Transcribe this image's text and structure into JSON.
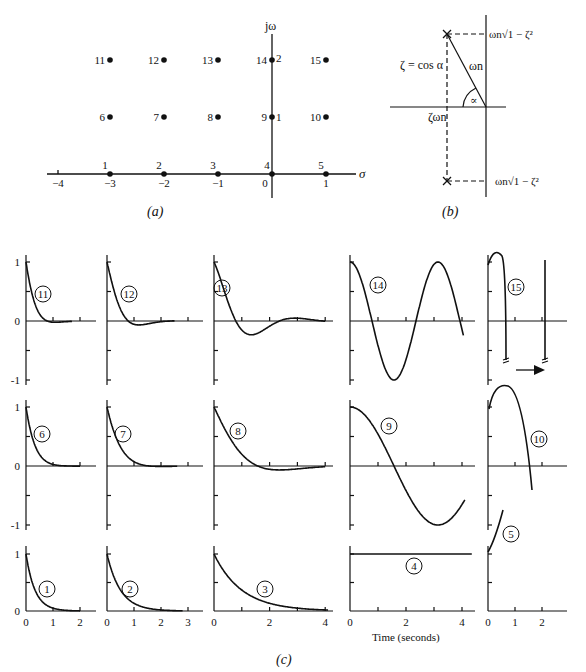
{
  "figure": {
    "panel_a": {
      "caption": "(a)",
      "axis_x_label": "σ",
      "axis_y_label": "jω",
      "x_ticks": [
        "-4",
        "-3",
        "-2",
        "-1",
        "0",
        "1"
      ],
      "points": [
        {
          "id": "1",
          "sigma": -3,
          "omega": 0
        },
        {
          "id": "2",
          "sigma": -2,
          "omega": 0
        },
        {
          "id": "3",
          "sigma": -1,
          "omega": 0
        },
        {
          "id": "4",
          "sigma": 0,
          "omega": 0
        },
        {
          "id": "5",
          "sigma": 1,
          "omega": 0
        },
        {
          "id": "6",
          "sigma": -3,
          "omega": 1
        },
        {
          "id": "7",
          "sigma": -2,
          "omega": 1
        },
        {
          "id": "8",
          "sigma": -1,
          "omega": 1
        },
        {
          "id": "9",
          "sigma": 0,
          "omega": 1
        },
        {
          "id": "10",
          "sigma": 1,
          "omega": 1
        },
        {
          "id": "11",
          "sigma": -3,
          "omega": 2
        },
        {
          "id": "12",
          "sigma": -2,
          "omega": 2
        },
        {
          "id": "13",
          "sigma": -1,
          "omega": 2
        },
        {
          "id": "14",
          "sigma": 0,
          "omega": 2
        },
        {
          "id": "15",
          "sigma": 1,
          "omega": 2
        }
      ],
      "y_marks": [
        "1",
        "2"
      ]
    },
    "panel_b": {
      "caption": "(b)",
      "zeta_label": "ζ = cos α",
      "omega_n_label": "ωn",
      "alpha_label": "∝",
      "zeta_omega_label": "ζωn",
      "upper_label": "ωn√1 − ζ²",
      "lower_label": "ωn√1 − ζ²"
    },
    "panel_c": {
      "caption": "(c)",
      "time_label": "Time (seconds)",
      "y_ticks": [
        "1",
        "0",
        "-1"
      ],
      "col1_ticks": [
        "0",
        "1",
        "2"
      ],
      "col2_ticks": [
        "0",
        "1",
        "2",
        "3"
      ],
      "col3_ticks": [
        "0",
        "2",
        "4"
      ],
      "col4_ticks": [
        "0",
        "2",
        "4"
      ],
      "col5_ticks": [
        "0",
        "1",
        "2"
      ],
      "labels": [
        "1",
        "2",
        "3",
        "4",
        "5",
        "6",
        "7",
        "8",
        "9",
        "10",
        "11",
        "12",
        "13",
        "14",
        "15"
      ]
    }
  },
  "chart_data": {
    "type": "line",
    "xlabel": "Time (seconds)",
    "ylabel": "",
    "pole_positions": [
      {
        "id": 1,
        "sigma": -3,
        "omega": 0
      },
      {
        "id": 2,
        "sigma": -2,
        "omega": 0
      },
      {
        "id": 3,
        "sigma": -1,
        "omega": 0
      },
      {
        "id": 4,
        "sigma": 0,
        "omega": 0
      },
      {
        "id": 5,
        "sigma": 1,
        "omega": 0
      },
      {
        "id": 6,
        "sigma": -3,
        "omega": 1
      },
      {
        "id": 7,
        "sigma": -2,
        "omega": 1
      },
      {
        "id": 8,
        "sigma": -1,
        "omega": 1
      },
      {
        "id": 9,
        "sigma": 0,
        "omega": 1
      },
      {
        "id": 10,
        "sigma": 1,
        "omega": 1
      },
      {
        "id": 11,
        "sigma": -3,
        "omega": 2
      },
      {
        "id": 12,
        "sigma": -2,
        "omega": 2
      },
      {
        "id": 13,
        "sigma": -1,
        "omega": 2
      },
      {
        "id": 14,
        "sigma": 0,
        "omega": 2
      },
      {
        "id": 15,
        "sigma": 1,
        "omega": 2
      }
    ],
    "series": [
      {
        "name": "1",
        "formula": "exp(-3t)",
        "x_range": [
          0,
          2
        ]
      },
      {
        "name": "2",
        "formula": "exp(-2t)",
        "x_range": [
          0,
          3
        ]
      },
      {
        "name": "3",
        "formula": "exp(-t)",
        "x_range": [
          0,
          4
        ]
      },
      {
        "name": "4",
        "formula": "1",
        "x_range": [
          0,
          4.3
        ]
      },
      {
        "name": "5",
        "formula": "exp(t)",
        "x_range": [
          0,
          0.7
        ]
      },
      {
        "name": "6",
        "formula": "exp(-3t)cos(t)",
        "x_range": [
          0,
          2
        ]
      },
      {
        "name": "7",
        "formula": "exp(-2t)cos(t)",
        "x_range": [
          0,
          3
        ]
      },
      {
        "name": "8",
        "formula": "exp(-t)cos(t)",
        "x_range": [
          0,
          4
        ]
      },
      {
        "name": "9",
        "formula": "cos(t)",
        "x_range": [
          0,
          4.3
        ]
      },
      {
        "name": "10",
        "formula": "exp(t)cos(t)",
        "x_range": [
          0,
          1.6
        ]
      },
      {
        "name": "11",
        "formula": "exp(-3t)cos(2t)",
        "x_range": [
          0,
          1.7
        ]
      },
      {
        "name": "12",
        "formula": "exp(-2t)cos(2t)",
        "x_range": [
          0,
          2.5
        ]
      },
      {
        "name": "13",
        "formula": "exp(-t)cos(2t)",
        "x_range": [
          0,
          4
        ]
      },
      {
        "name": "14",
        "formula": "cos(2t)",
        "x_range": [
          0,
          4
        ]
      },
      {
        "name": "15",
        "formula": "exp(t)cos(2t)",
        "x_range": [
          0,
          2
        ]
      }
    ],
    "ylim": [
      -1,
      1
    ],
    "grid": false
  }
}
